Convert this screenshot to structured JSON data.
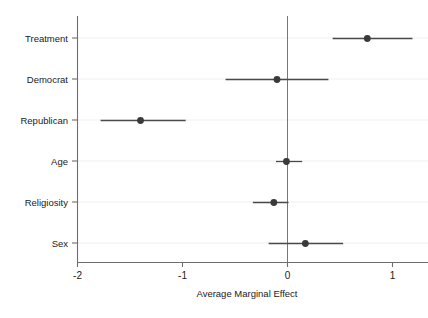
{
  "chart_data": {
    "type": "scatter",
    "subtype": "coefficient-plot",
    "title": "",
    "subtitle": "",
    "xlabel": "Average Marginal Effect",
    "ylabel": "",
    "xlim": [
      -2.2,
      1.35
    ],
    "ylim": [
      0,
      7
    ],
    "grid": true,
    "grid_axis": "y",
    "legend": false,
    "legend_position": "none",
    "reference_line": {
      "x": 0,
      "orientation": "vertical",
      "color": "#666666"
    },
    "x_ticks": [
      -2,
      -1,
      0,
      1
    ],
    "x_tick_labels": [
      "-2",
      "-1",
      "0",
      "1"
    ],
    "categories": [
      "Treatment",
      "Democrat",
      "Republican",
      "Age",
      "Religiosity",
      "Sex"
    ],
    "series": [
      {
        "name": "Average Marginal Effect",
        "marker": "filled-circle",
        "color": "#3a3a3a",
        "values": [
          0.76,
          -0.1,
          -1.4,
          -0.01,
          -0.13,
          0.17
        ],
        "ci_low": [
          0.43,
          -0.59,
          -1.78,
          -0.11,
          -0.33,
          -0.18
        ],
        "ci_high": [
          1.19,
          0.39,
          -0.97,
          0.14,
          0.01,
          0.53
        ]
      }
    ],
    "points": [
      {
        "label": "Treatment",
        "estimate": 0.76,
        "ci_low": 0.43,
        "ci_high": 1.19
      },
      {
        "label": "Democrat",
        "estimate": -0.1,
        "ci_low": -0.59,
        "ci_high": 0.39
      },
      {
        "label": "Republican",
        "estimate": -1.4,
        "ci_low": -1.78,
        "ci_high": -0.97
      },
      {
        "label": "Age",
        "estimate": -0.01,
        "ci_low": -0.11,
        "ci_high": 0.14
      },
      {
        "label": "Religiosity",
        "estimate": -0.13,
        "ci_low": -0.33,
        "ci_high": 0.01
      },
      {
        "label": "Sex",
        "estimate": 0.17,
        "ci_low": -0.18,
        "ci_high": 0.53
      }
    ]
  },
  "style": {
    "background": "#ffffff",
    "axis_color": "#6e6e6e",
    "gridline_color": "#f4f4f4",
    "marker_color": "#3a3a3a",
    "whisker_color": "#4a4a4a",
    "text_color": "#1a1a1a"
  }
}
